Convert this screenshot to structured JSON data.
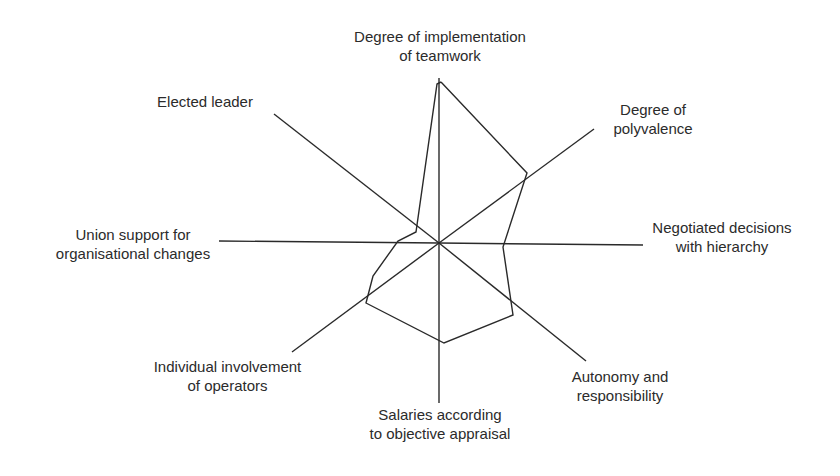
{
  "chart_data": {
    "type": "radar",
    "title": "",
    "center": [
      439,
      243
    ],
    "axes": [
      {
        "key": "teamwork",
        "label_lines": [
          "Degree of implementation",
          "of teamwork"
        ],
        "end": [
          439,
          78
        ],
        "value": 0.99
      },
      {
        "key": "polyvalence",
        "label_lines": [
          "Degree of",
          "polyvalence"
        ],
        "end": [
          594,
          129
        ],
        "value": 0.58
      },
      {
        "key": "negotiated",
        "label_lines": [
          "Negotiated decisions",
          "with hierarchy"
        ],
        "end": [
          643,
          245
        ],
        "value": 0.32
      },
      {
        "key": "autonomy",
        "label_lines": [
          "Autonomy and",
          "responsibility"
        ],
        "end": [
          586,
          361
        ],
        "value": 0.55
      },
      {
        "key": "salaries",
        "label_lines": [
          "Salaries according",
          "to objective appraisal"
        ],
        "end": [
          439,
          403
        ],
        "value": 0.63
      },
      {
        "key": "individual",
        "label_lines": [
          "Individual involvement",
          "of operators"
        ],
        "end": [
          292,
          352
        ],
        "value": 0.51
      },
      {
        "key": "union",
        "label_lines": [
          "Union support for",
          "organisational changes"
        ],
        "end": [
          219,
          241
        ],
        "value": 0.22
      },
      {
        "key": "elected",
        "label_lines": [
          "Elected leader"
        ],
        "end": [
          274,
          114
        ],
        "value": 0.13
      }
    ],
    "polygon_points": [
      [
        441,
        82
      ],
      [
        527,
        173
      ],
      [
        503,
        247
      ],
      [
        513,
        315
      ],
      [
        444,
        343
      ],
      [
        366,
        303
      ],
      [
        373,
        276
      ],
      [
        398,
        241
      ],
      [
        416,
        232
      ],
      [
        437,
        84
      ],
      [
        441,
        82
      ]
    ],
    "grid": false,
    "legend": null,
    "colors": {
      "line": "#2a2a2a",
      "background": "#ffffff"
    }
  },
  "labels": {
    "teamwork": [
      "Degree of implementation",
      "of teamwork"
    ],
    "polyvalence": [
      "Degree of",
      "polyvalence"
    ],
    "negotiated": [
      "Negotiated decisions",
      "with hierarchy"
    ],
    "autonomy": [
      "Autonomy and",
      "responsibility"
    ],
    "salaries": [
      "Salaries according",
      "to objective appraisal"
    ],
    "individual": [
      "Individual involvement",
      "of operators"
    ],
    "union": [
      "Union support for",
      "organisational changes"
    ],
    "elected": [
      "Elected leader"
    ]
  }
}
